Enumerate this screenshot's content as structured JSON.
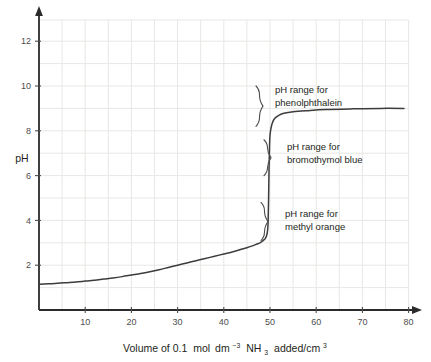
{
  "chart_data": {
    "type": "line",
    "title": "",
    "xlabel": "Volume of 0.1 mol dm-3 NH3 added/cm3",
    "xlabel_parts": {
      "p1": "Volume of 0.1",
      "p2": "mol",
      "p3": "dm",
      "p4": "−3",
      "p5": "NH",
      "p6": "3",
      "p7": "added/cm",
      "p8": "3"
    },
    "ylabel": "pH",
    "xlim": [
      0,
      87
    ],
    "ylim": [
      0,
      13.5
    ],
    "grid": true,
    "grid_step_x": 5,
    "grid_step_y": 1,
    "xticks": [
      10,
      20,
      30,
      40,
      50,
      60,
      70,
      80
    ],
    "xtick_labels": [
      "10",
      "20",
      "30",
      "40",
      "50",
      "60",
      "70",
      "80"
    ],
    "yticks": [
      2,
      4,
      6,
      8,
      10,
      12
    ],
    "ytick_labels": [
      "2",
      "4",
      "6",
      "8",
      "10",
      "12"
    ],
    "legend": "none",
    "curve_color": "#3c3c3c",
    "axis_color": "#2b2b2b",
    "grid_color": "#e8e6e4",
    "series": [
      {
        "name": "Titration curve: 0.1 mol dm-3 NH3 added to strong acid",
        "points": [
          [
            0,
            1.15
          ],
          [
            2,
            1.17
          ],
          [
            4,
            1.19
          ],
          [
            6,
            1.22
          ],
          [
            8,
            1.25
          ],
          [
            10,
            1.29
          ],
          [
            12,
            1.33
          ],
          [
            14,
            1.38
          ],
          [
            16,
            1.43
          ],
          [
            18,
            1.49
          ],
          [
            20,
            1.56
          ],
          [
            22,
            1.63
          ],
          [
            24,
            1.71
          ],
          [
            26,
            1.8
          ],
          [
            28,
            1.9
          ],
          [
            30,
            2.0
          ],
          [
            32,
            2.1
          ],
          [
            34,
            2.2
          ],
          [
            36,
            2.3
          ],
          [
            38,
            2.4
          ],
          [
            40,
            2.5
          ],
          [
            42,
            2.6
          ],
          [
            44,
            2.72
          ],
          [
            45,
            2.78
          ],
          [
            46,
            2.85
          ],
          [
            47,
            2.93
          ],
          [
            48,
            3.02
          ],
          [
            48.5,
            3.1
          ],
          [
            49,
            3.2
          ],
          [
            49.3,
            3.35
          ],
          [
            49.5,
            3.6
          ],
          [
            49.6,
            4.0
          ],
          [
            49.7,
            5.0
          ],
          [
            49.8,
            6.4
          ],
          [
            49.9,
            7.3
          ],
          [
            50,
            7.8
          ],
          [
            50.2,
            8.1
          ],
          [
            50.5,
            8.35
          ],
          [
            51,
            8.55
          ],
          [
            52,
            8.7
          ],
          [
            53,
            8.78
          ],
          [
            55,
            8.85
          ],
          [
            58,
            8.9
          ],
          [
            62,
            8.95
          ],
          [
            68,
            8.98
          ],
          [
            74,
            9.0
          ],
          [
            79,
            9.0
          ]
        ]
      }
    ],
    "annotations": [
      {
        "id": "phenolphthalein",
        "line1": "pH range for",
        "line2": "phenolphthalein",
        "ph_from": 8.2,
        "ph_to": 10.0
      },
      {
        "id": "bromothymol-blue",
        "line1": "pH range for",
        "line2": "bromothymol blue",
        "ph_from": 6.0,
        "ph_to": 7.6
      },
      {
        "id": "methyl-orange",
        "line1": "pH range for",
        "line2": "methyl orange",
        "ph_from": 3.1,
        "ph_to": 4.8
      }
    ]
  }
}
